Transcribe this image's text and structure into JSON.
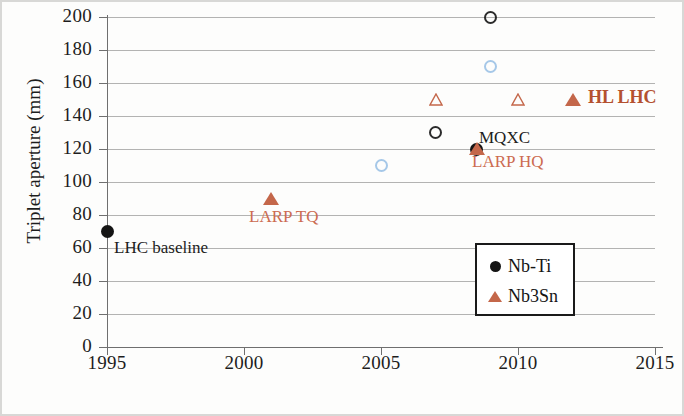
{
  "chart_data": {
    "type": "scatter",
    "title": "",
    "xlabel": "",
    "ylabel": "Triplet aperture (mm)",
    "xlim": [
      1995,
      2015
    ],
    "ylim": [
      0,
      200
    ],
    "xticks": [
      "1995",
      "2000",
      "2005",
      "2010",
      "2015"
    ],
    "yticks": [
      "0",
      "20",
      "40",
      "60",
      "80",
      "100",
      "120",
      "140",
      "160",
      "180",
      "200"
    ],
    "grid": "horizontal",
    "legend_position": "bottom-right",
    "series": [
      {
        "name": "Nb-Ti",
        "marker": "circle",
        "color": "#141414",
        "points": [
          {
            "x": 1995,
            "y": 70,
            "style": "filled",
            "label": "LHC baseline"
          },
          {
            "x": 2007,
            "y": 130,
            "style": "open",
            "label": ""
          },
          {
            "x": 2008.5,
            "y": 120,
            "style": "filled",
            "label": "MQXC"
          },
          {
            "x": 2009,
            "y": 200,
            "style": "open",
            "label": ""
          },
          {
            "x": 2005,
            "y": 110,
            "style": "open-light",
            "label": ""
          },
          {
            "x": 2009,
            "y": 170,
            "style": "open-light",
            "label": ""
          }
        ]
      },
      {
        "name": "Nb3Sn",
        "marker": "triangle",
        "color": "#c4674a",
        "points": [
          {
            "x": 2001,
            "y": 90,
            "style": "filled",
            "label": "LARP TQ"
          },
          {
            "x": 2007,
            "y": 150,
            "style": "open",
            "label": ""
          },
          {
            "x": 2008.5,
            "y": 120,
            "style": "filled",
            "label": "LARP HQ"
          },
          {
            "x": 2010,
            "y": 150,
            "style": "open",
            "label": ""
          },
          {
            "x": 2012,
            "y": 150,
            "style": "filled",
            "label": "HL LHC"
          }
        ]
      }
    ],
    "annotations": [
      {
        "text": "LHC baseline",
        "color": "#1d1d1d"
      },
      {
        "text": "LARP TQ",
        "color": "#cc6b50"
      },
      {
        "text": "MQXC",
        "color": "#1d1d1d"
      },
      {
        "text": "LARP HQ",
        "color": "#cc6b50"
      },
      {
        "text": "HL LHC",
        "color": "#b4512f"
      }
    ],
    "legend": [
      {
        "label": "Nb-Ti",
        "marker": "circle",
        "color": "#141414"
      },
      {
        "label": "Nb3Sn",
        "marker": "triangle",
        "color": "#c4674a"
      }
    ]
  },
  "axes": {
    "y_title": "Triplet aperture (mm)",
    "y_ticks": [
      "200",
      "180",
      "160",
      "140",
      "120",
      "100",
      "80",
      "60",
      "40",
      "20",
      "0"
    ],
    "x_ticks": [
      "1995",
      "2000",
      "2005",
      "2010",
      "2015"
    ]
  },
  "annotations": {
    "lhc_baseline": "LHC baseline",
    "larp_tq": "LARP TQ",
    "mqxc": "MQXC",
    "larp_hq": "LARP HQ",
    "hl_lhc": "HL LHC"
  },
  "legend": {
    "nbti": "Nb-Ti",
    "nb3sn": "Nb3Sn"
  }
}
